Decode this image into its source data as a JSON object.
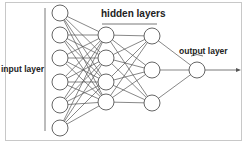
{
  "diagram": {
    "type": "neural-network",
    "labels": {
      "input": "input layer",
      "hidden": "hidden layers",
      "output": "output layer"
    },
    "layers": [
      {
        "name": "input",
        "x": 60,
        "nodes": [
          13,
          35,
          58,
          82,
          105,
          128
        ]
      },
      {
        "name": "hidden1",
        "x": 106,
        "nodes": [
          35,
          58,
          82,
          102
        ]
      },
      {
        "name": "hidden2",
        "x": 152,
        "nodes": [
          36,
          70,
          103
        ]
      },
      {
        "name": "output",
        "x": 197,
        "nodes": [
          70
        ]
      }
    ],
    "node_radius": 8,
    "colors": {
      "stroke": "#555555",
      "node_fill": "#ffffff",
      "text": "#222222"
    }
  }
}
